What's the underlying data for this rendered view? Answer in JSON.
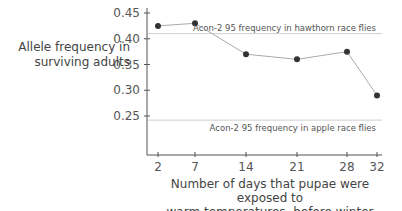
{
  "chart_data": {
    "type": "line",
    "title": "",
    "xlabel": "Number of days that pupae were exposed to warm temperatures, before winter",
    "xlabel_lines": [
      "Number of days that pupae were exposed to",
      "warm temperatures, before winter"
    ],
    "ylabel": "Allele frequency in surviving adults",
    "ylabel_lines": [
      "Allele frequency in",
      "surviving adults"
    ],
    "x": [
      2,
      7,
      14,
      21,
      28,
      32
    ],
    "x_tick_labels": [
      "2",
      "7",
      "14",
      "21",
      "28",
      "32"
    ],
    "series": [
      {
        "name": "Allele frequency in surviving adults",
        "values": [
          0.425,
          0.43,
          0.37,
          0.36,
          0.375,
          0.29
        ],
        "color": "#333333"
      }
    ],
    "y_ticks": [
      0.45,
      0.4,
      0.35,
      0.3,
      0.25
    ],
    "y_tick_labels": [
      "0.45",
      "0.40",
      "0.35",
      "0.30",
      "0.25"
    ],
    "ylim": [
      0.19,
      0.45
    ],
    "xlim": [
      0,
      33
    ],
    "grid": false,
    "reference_lines": [
      {
        "label": "Acon-2 95 frequency in hawthorn race flies",
        "value": 0.41
      },
      {
        "label": "Acon-2 95 frequency in apple race flies",
        "value": 0.242
      }
    ]
  }
}
